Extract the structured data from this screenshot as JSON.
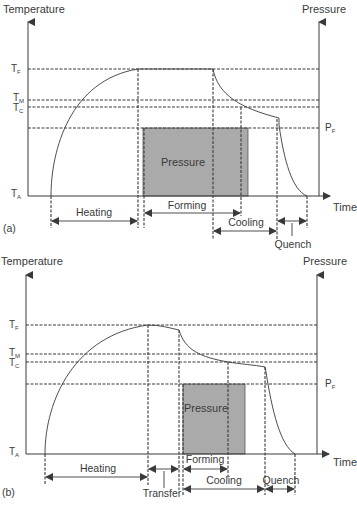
{
  "figure": {
    "colors": {
      "line": "#3a3a3a",
      "pressure_fill": "#aaaaaa",
      "background": "#ffffff"
    },
    "panel_a": {
      "tag": "(a)",
      "left_axis_label": "Temperature",
      "right_axis_label": "Pressure",
      "x_axis_label": "Time",
      "levels": {
        "TF": {
          "main": "T",
          "sub": "F"
        },
        "TM": {
          "main": "T",
          "sub": "M"
        },
        "TC": {
          "main": "T",
          "sub": "C"
        },
        "TA": {
          "main": "T",
          "sub": "A"
        },
        "PF": {
          "main": "P",
          "sub": "F"
        }
      },
      "pressure_box_label": "Pressure",
      "phases": {
        "heating": "Heating",
        "forming": "Forming",
        "cooling": "Cooling",
        "quench": "Quench"
      }
    },
    "panel_b": {
      "tag": "(b)",
      "left_axis_label": "Temperature",
      "right_axis_label": "Pressure",
      "x_axis_label": "Time",
      "levels": {
        "TF": {
          "main": "T",
          "sub": "F"
        },
        "TM": {
          "main": "T",
          "sub": "M"
        },
        "TC": {
          "main": "T",
          "sub": "C"
        },
        "TA": {
          "main": "T",
          "sub": "A"
        },
        "PF": {
          "main": "P",
          "sub": "F"
        }
      },
      "pressure_box_label": "Pressure",
      "phases": {
        "heating": "Heating",
        "transfer": "Transfer",
        "forming": "Forming",
        "cooling": "Cooling",
        "quench": "Quench"
      }
    }
  }
}
